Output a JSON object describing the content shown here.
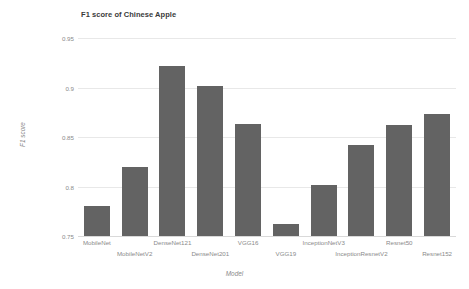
{
  "chart_data": {
    "type": "bar",
    "title": "F1 score of Chinese Apple",
    "xlabel": "Model",
    "ylabel": "F1 score",
    "categories": [
      "MobileNet",
      "MobileNetV2",
      "DenseNet121",
      "DenseNet201",
      "VGG16",
      "VGG19",
      "InceptionNetV3",
      "InceptionResnetV2",
      "Resnet50",
      "Resnet152"
    ],
    "values": [
      0.78,
      0.82,
      0.922,
      0.902,
      0.863,
      0.762,
      0.802,
      0.842,
      0.862,
      0.873
    ],
    "ylim": [
      0.75,
      0.95
    ],
    "yticks": [
      0.75,
      0.8,
      0.85,
      0.9,
      0.95
    ],
    "ytick_labels": [
      "0.75",
      "0.8",
      "0.85",
      "0.9",
      "0.95"
    ],
    "grid": true,
    "legend": false,
    "bar_color": "#636363",
    "grid_color": "#e8e8e8",
    "tick_color": "#8a8a8a"
  }
}
